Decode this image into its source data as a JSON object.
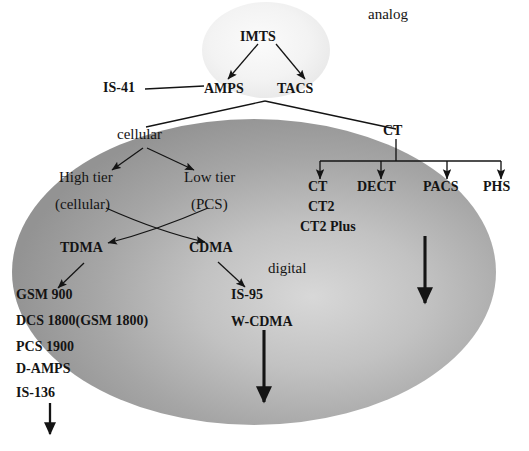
{
  "diagram": {
    "regions": [
      {
        "id": "analog_region",
        "label": "analog",
        "type": "ellipse-label"
      },
      {
        "id": "digital_region",
        "label": "digital",
        "type": "ellipse-label"
      }
    ],
    "nodes": {
      "imts": "IMTS",
      "amps": "AMPS",
      "tacs": "TACS",
      "is41": "IS-41",
      "cellular": "cellular",
      "ct_root": "CT",
      "high_tier": "High tier",
      "high_tier_sub": "(cellular)",
      "low_tier": "Low tier",
      "low_tier_sub": "(PCS)",
      "tdma": "TDMA",
      "cdma": "CDMA",
      "ct_leaf": "CT",
      "dect": "DECT",
      "pacs": "PACS",
      "phs": "PHS"
    },
    "ct_variants": [
      "CT2",
      "CT2 Plus"
    ],
    "tdma_standards": [
      "GSM 900",
      "DCS 1800(GSM 1800)",
      "PCS 1900",
      "D-AMPS",
      "IS-136"
    ],
    "cdma_standards": [
      "IS-95",
      "W-CDMA"
    ],
    "edges": [
      {
        "from": "IMTS",
        "to": "AMPS",
        "kind": "arrow"
      },
      {
        "from": "IMTS",
        "to": "TACS",
        "kind": "arrow"
      },
      {
        "from": "IS-41",
        "to": "AMPS",
        "kind": "line"
      },
      {
        "from": "AMPS/TACS",
        "to": "cellular",
        "kind": "line"
      },
      {
        "from": "AMPS/TACS",
        "to": "CT",
        "kind": "line"
      },
      {
        "from": "cellular",
        "to": "High tier",
        "kind": "arrow"
      },
      {
        "from": "cellular",
        "to": "Low tier",
        "kind": "arrow"
      },
      {
        "from": "High tier (cellular)",
        "to": "CDMA",
        "kind": "arrow"
      },
      {
        "from": "Low tier (PCS)",
        "to": "TDMA",
        "kind": "arrow"
      },
      {
        "from": "TDMA",
        "to": "GSM 900",
        "kind": "arrow"
      },
      {
        "from": "CDMA",
        "to": "IS-95",
        "kind": "arrow"
      },
      {
        "from": "CT",
        "to": "CT",
        "kind": "arrow"
      },
      {
        "from": "CT",
        "to": "DECT",
        "kind": "arrow"
      },
      {
        "from": "CT",
        "to": "PACS",
        "kind": "arrow"
      },
      {
        "from": "CT",
        "to": "PHS",
        "kind": "arrow"
      },
      {
        "from": "tdma_standards",
        "to": "below",
        "kind": "thin-down-arrow"
      },
      {
        "from": "cdma_standards",
        "to": "below",
        "kind": "thick-down-arrow"
      },
      {
        "from": "ct_branch",
        "to": "below",
        "kind": "thick-down-arrow"
      }
    ],
    "colors": {
      "ink": "#141414",
      "digital_fill": "#9a9a9a",
      "digital_fill_light": "#cfcfcf",
      "analog_fill": "#f1f1f1",
      "background": "#ffffff"
    }
  }
}
